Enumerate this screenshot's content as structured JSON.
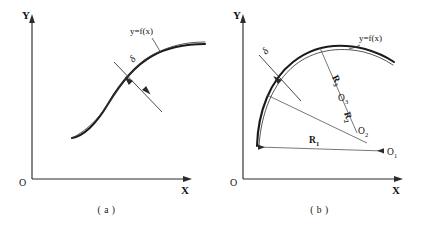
{
  "figure": {
    "width": 426,
    "height": 233,
    "background": "#ffffff",
    "ink_color": "#1a1a1a"
  },
  "panel_a": {
    "caption": "( a )",
    "axis": {
      "y_label": "Y",
      "x_label": "X",
      "origin_label": "O"
    },
    "function_label": "y=f(x)",
    "tolerance_label": "δ",
    "description": "S-shaped curve drawn as a double line representing a tolerance band, with a perpendicular double-headed arrow marking the band width delta"
  },
  "panel_b": {
    "caption": "( b )",
    "axis": {
      "y_label": "Y",
      "x_label": "X",
      "origin_label": "O"
    },
    "function_label": "y=f(x)",
    "tolerance_label": "δ",
    "radii": [
      {
        "letter": "R",
        "sub": "1"
      },
      {
        "letter": "R",
        "sub": "2"
      },
      {
        "letter": "R",
        "sub": "3"
      }
    ],
    "centers": [
      {
        "letter": "O",
        "sub": "1"
      },
      {
        "letter": "O",
        "sub": "2"
      },
      {
        "letter": "O",
        "sub": "3"
      }
    ],
    "description": "Convex arc approximated by three circular arcs with radii R1, R2, R3 whose centers O1, O2, O3 lie along a converging radial direction"
  }
}
